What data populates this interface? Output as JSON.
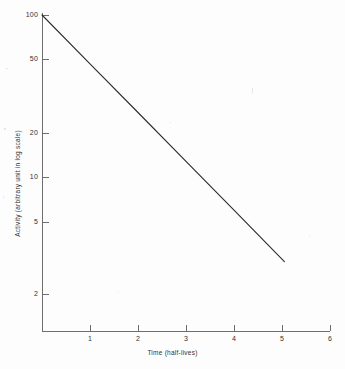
{
  "chart_data": {
    "type": "line",
    "title": "",
    "xlabel": "Time (half-lives)",
    "ylabel": "Activity (arbitrary unit in log scale)",
    "yscale": "log",
    "xscale": "linear",
    "xlim": [
      0,
      6
    ],
    "ylim": [
      1.6,
      100
    ],
    "grid": false,
    "legend": null,
    "x_ticks": [
      "1",
      "2",
      "3",
      "4",
      "5",
      "6"
    ],
    "x_tick_values": [
      1,
      2,
      3,
      4,
      5,
      6
    ],
    "y_ticks": [
      "100",
      "50",
      "20",
      "10",
      "5",
      "2"
    ],
    "y_tick_values": [
      100,
      50,
      20,
      10,
      5,
      2
    ],
    "series": [
      {
        "name": "Radioactive decay",
        "color": "#2b2b2b",
        "x": [
          0,
          1,
          2,
          3,
          4,
          5.05
        ],
        "values": [
          100,
          50,
          25,
          12.5,
          6.25,
          3.0
        ]
      }
    ],
    "annotations": []
  },
  "axes": {
    "y_title": "Activity (arbitrary unit in log scale)",
    "x_title": "Time (half-lives)"
  },
  "colors": {
    "axis": "#6e6e6e",
    "line": "#2b2b2b",
    "text": "#30302f",
    "background": "#fdfdfd"
  }
}
